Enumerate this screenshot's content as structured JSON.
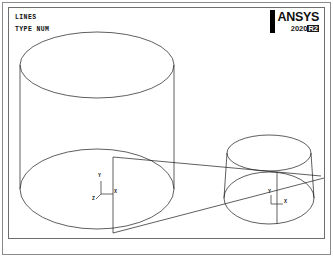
{
  "window": {
    "title": "ANSYS Mechanical APDL Graphics Window",
    "background_color": "#ffffff",
    "frame_color": "#8a8a8a",
    "plot_frame_color": "#6e6e6e"
  },
  "branding": {
    "name": "ANSYS",
    "release": "2020",
    "release_badge": "R2",
    "bar_color": "#000000"
  },
  "plot_header": {
    "lines": [
      {
        "id": "entity-type",
        "text": "LINES"
      },
      {
        "id": "label-mode",
        "text": "TYPE NUM"
      }
    ]
  },
  "geometry": {
    "line_color": "#1a1a1a",
    "line_width": 0.7,
    "description": "Two coaxial-stacked circular cylinders joined by tangent lines",
    "objects": [
      {
        "name": "large-cylinder",
        "top_ellipse": {
          "cx": 88,
          "cy": 57,
          "rx": 77,
          "ry": 33
        },
        "bottom_ellipse": {
          "cx": 88,
          "cy": 181,
          "rx": 77,
          "ry": 40
        },
        "left_side_x": 11,
        "right_side_x": 165,
        "axis_line": {
          "x": 104,
          "y_top": 149,
          "y_bottom": 225
        }
      },
      {
        "name": "small-cylinder",
        "top_ellipse": {
          "cx": 260,
          "cy": 145,
          "rx": 42,
          "ry": 18
        },
        "bottom_ellipse": {
          "cx": 260,
          "cy": 190,
          "rx": 45,
          "ry": 26
        },
        "left_side_x": 218,
        "right_side_x": 302,
        "axis_line": {
          "x": 268,
          "y_top": 164,
          "y_bottom": 216
        }
      }
    ],
    "connectors": [
      {
        "name": "upper-tangent-line",
        "x1": 104,
        "y1": 149,
        "x2": 305,
        "y2": 170
      },
      {
        "name": "lower-tangent-line",
        "x1": 104,
        "y1": 225,
        "x2": 310,
        "y2": 173
      }
    ]
  },
  "triads": [
    {
      "name": "global-axis-triad",
      "origin_x": 92,
      "origin_y": 186,
      "axes": [
        {
          "label": "Y",
          "direction": "up"
        },
        {
          "label": "X",
          "direction": "right"
        },
        {
          "label": "Z",
          "direction": "out"
        }
      ]
    },
    {
      "name": "local-axis-triad",
      "origin_x": 262,
      "origin_y": 196,
      "axes": [
        {
          "label": "Y",
          "direction": "up"
        },
        {
          "label": "X",
          "direction": "right"
        }
      ]
    }
  ]
}
